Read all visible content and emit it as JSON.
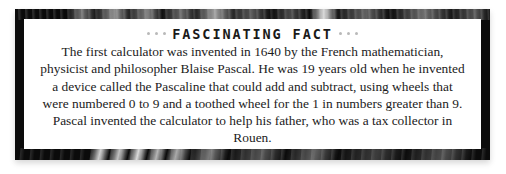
{
  "callout": {
    "heading": "FASCINATING FACT",
    "heading_left_dots": [
      "·",
      "·",
      "·"
    ],
    "heading_right_dots": [
      "·",
      "·",
      "·"
    ],
    "body": "The first calculator was invented in 1640 by the French mathematician, physicist and philosopher Blaise Pascal. He was 19 years old when he invented a device called the Pascaline that could add and subtract, using wheels that were numbered 0 to 9 and a toothed wheel for the 1 in numbers greater than 9. Pascal invented the calculator to help his father, who was a tax collector in Rouen.",
    "colors": {
      "frame": "#0b0b0b",
      "paper": "#ffffff",
      "text": "#1b1b1b",
      "heading_text": "#1a1a1a",
      "dot": "#b9b9b9"
    }
  }
}
